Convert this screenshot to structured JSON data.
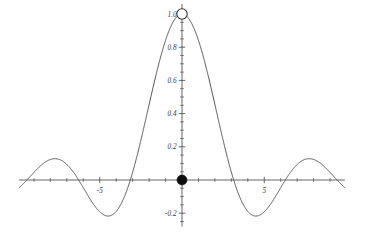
{
  "figure": {
    "title": "",
    "background_color": "#ffffff",
    "curve_color": "#4a4a4a",
    "axis_color": "#555555",
    "label_color": "#3b3b3b"
  },
  "chart_data": {
    "type": "line",
    "title": "",
    "xlabel": "",
    "ylabel": "",
    "function": "sin(x)/x",
    "xlim": [
      -9.9,
      9.9
    ],
    "ylim": [
      -0.28,
      1.06
    ],
    "grid": false,
    "legend": null,
    "x_ticks_major": [
      -5,
      5
    ],
    "x_tick_labels": [
      "-5",
      "5"
    ],
    "x_ticks_minor": [
      -9,
      -8,
      -7,
      -6,
      -4,
      -3,
      -2,
      -1,
      1,
      2,
      3,
      4,
      6,
      7,
      8,
      9
    ],
    "y_ticks_major": [
      -0.2,
      0.2,
      0.4,
      0.6,
      0.8,
      1.0
    ],
    "y_tick_labels": [
      "-0.2",
      "0.2",
      "0.4",
      "0.6",
      "0.8",
      "1.0"
    ],
    "y_ticks_minor": [
      -0.25,
      -0.15,
      -0.1,
      -0.05,
      0.05,
      0.1,
      0.15,
      0.25,
      0.3,
      0.35,
      0.45,
      0.5,
      0.55,
      0.65,
      0.7,
      0.75,
      0.85,
      0.9,
      0.95
    ],
    "markers": [
      {
        "name": "open-circle-hole",
        "x": 0,
        "y": 1.0,
        "style": "open",
        "label": "removable discontinuity at (0, 1)"
      },
      {
        "name": "filled-point",
        "x": 0,
        "y": 0.0,
        "style": "filled",
        "label": "defined value at (0, 0)"
      }
    ],
    "key_points": {
      "central_peak": {
        "x": 0,
        "y": 1.0
      },
      "zeros": [
        -9.4248,
        -6.2832,
        -3.1416,
        3.1416,
        6.2832,
        9.4248
      ],
      "local_minima": [
        {
          "x": -4.493,
          "y": -0.2172
        },
        {
          "x": 4.493,
          "y": -0.2172
        }
      ],
      "local_maxima": [
        {
          "x": -7.725,
          "y": 0.1284
        },
        {
          "x": 7.725,
          "y": 0.1284
        }
      ]
    },
    "x": [
      -9.9,
      -9.7,
      -9.5,
      -9.3,
      -9.1,
      -8.9,
      -8.7,
      -8.5,
      -8.3,
      -8.1,
      -7.9,
      -7.7,
      -7.5,
      -7.3,
      -7.1,
      -6.9,
      -6.7,
      -6.5,
      -6.3,
      -6.1,
      -5.9,
      -5.7,
      -5.5,
      -5.3,
      -5.1,
      -4.9,
      -4.7,
      -4.5,
      -4.3,
      -4.1,
      -3.9,
      -3.7,
      -3.5,
      -3.3,
      -3.1,
      -2.9,
      -2.7,
      -2.5,
      -2.3,
      -2.1,
      -1.9,
      -1.7,
      -1.5,
      -1.3,
      -1.1,
      -0.9,
      -0.7,
      -0.5,
      -0.3,
      -0.1,
      0.1,
      0.3,
      0.5,
      0.7,
      0.9,
      1.1,
      1.3,
      1.5,
      1.7,
      1.9,
      2.1,
      2.3,
      2.5,
      2.7,
      2.9,
      3.1,
      3.3,
      3.5,
      3.7,
      3.9,
      4.1,
      4.3,
      4.5,
      4.7,
      4.9,
      5.1,
      5.3,
      5.5,
      5.7,
      5.9,
      6.1,
      6.3,
      6.5,
      6.7,
      6.9,
      7.1,
      7.3,
      7.5,
      7.7,
      7.9,
      8.1,
      8.3,
      8.5,
      8.7,
      8.9,
      9.1,
      9.3,
      9.5,
      9.7,
      9.9
    ],
    "y": [
      -0.0459,
      -0.0381,
      -0.0269,
      -0.0136,
      0.0007,
      0.0149,
      0.0279,
      0.0387,
      0.0465,
      0.0508,
      0.0514,
      0.0483,
      0.0418,
      0.0325,
      0.0211,
      0.0086,
      -0.0041,
      -0.0162,
      -0.0268,
      -0.0352,
      -0.0409,
      -0.0435,
      -0.0429,
      -0.0393,
      -0.033,
      -0.0246,
      -0.0147,
      -0.0042,
      0.0062,
      0.0157,
      0.0236,
      0.0292,
      0.0322,
      0.0323,
      0.0296,
      0.0243,
      0.0167,
      0.0074,
      -0.0029,
      -0.0134,
      -0.0233,
      -0.0317,
      -0.038,
      -0.0417,
      -0.0423,
      -0.0397,
      -0.034,
      -0.0254,
      -0.0145,
      -0.0021,
      0.0112,
      0.0247,
      0.0378,
      0.0497,
      0.0599,
      0.0678,
      0.0731,
      0.0755,
      0.0748,
      0.0711,
      0.0645,
      0.0553,
      0.0439,
      0.0307,
      0.0163,
      0.0014,
      -0.0136,
      -0.028,
      -0.0414,
      -0.0531,
      -0.0629,
      -0.0704,
      -0.0753,
      -0.0774,
      -0.0767,
      -0.0733,
      -0.0671,
      -0.0585,
      -0.0478,
      -0.0353,
      -0.0215,
      -0.007,
      0.0077,
      0.0221,
      0.0356,
      0.0476,
      0.0578,
      0.0658,
      0.0711,
      0.0737,
      0.0734,
      0.0703,
      0.0644,
      0.0562,
      0.0459,
      0.0339,
      0.0208,
      0.0071,
      -0.0068,
      -0.0203
    ]
  }
}
